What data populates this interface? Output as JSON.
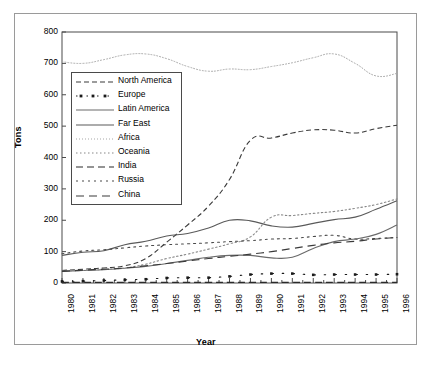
{
  "chart_data": {
    "type": "line",
    "title": "",
    "xlabel": "Year",
    "ylabel": "Tons",
    "xlim": [
      1980,
      1996
    ],
    "ylim": [
      0,
      800
    ],
    "ytick_labels": [
      "800",
      "700",
      "600",
      "500",
      "400",
      "300",
      "200",
      "100",
      "0"
    ],
    "ytick_values": [
      800,
      700,
      600,
      500,
      400,
      300,
      200,
      100,
      0
    ],
    "grid": false,
    "legend_position": "upper-left-inside",
    "x": [
      1980,
      1981,
      1982,
      1983,
      1984,
      1985,
      1986,
      1987,
      1988,
      1989,
      1990,
      1991,
      1992,
      1993,
      1994,
      1995,
      1996
    ],
    "categories": [
      "1980",
      "1981",
      "1982",
      "1983",
      "1984",
      "1985",
      "1986",
      "1987",
      "1988",
      "1989",
      "1990",
      "1991",
      "1992",
      "1993",
      "1994",
      "1995",
      "1996"
    ],
    "series": [
      {
        "name": "North America",
        "style": "dashed",
        "dash": "5,3",
        "color": "#3a3a3a",
        "values": [
          40,
          44,
          48,
          55,
          78,
          130,
          185,
          245,
          330,
          455,
          462,
          478,
          488,
          487,
          478,
          492,
          503
        ]
      },
      {
        "name": "Europe",
        "style": "dotted-square-markers",
        "dash": "1.5,9",
        "color": "#1a1a1a",
        "values": [
          5,
          6,
          8,
          10,
          12,
          16,
          17,
          17,
          21,
          27,
          30,
          30,
          26,
          27,
          27,
          27,
          28
        ]
      },
      {
        "name": "Latin America",
        "style": "solid",
        "dash": "none",
        "color": "#6a6a6a",
        "values": [
          37,
          40,
          42,
          47,
          53,
          62,
          72,
          82,
          88,
          88,
          80,
          82,
          110,
          132,
          140,
          155,
          185
        ]
      },
      {
        "name": "Far East",
        "style": "solid",
        "dash": "none",
        "color": "#5a5a5a",
        "values": [
          88,
          98,
          103,
          122,
          133,
          150,
          158,
          175,
          200,
          198,
          182,
          178,
          190,
          202,
          210,
          235,
          262
        ]
      },
      {
        "name": "Africa",
        "style": "dotted",
        "dash": "1,2",
        "color": "#a8a8a8",
        "values": [
          705,
          700,
          712,
          727,
          730,
          715,
          690,
          675,
          682,
          680,
          690,
          702,
          718,
          730,
          700,
          660,
          668
        ]
      },
      {
        "name": "Oceania",
        "style": "dotted-fine",
        "dash": "1.5,2.5",
        "color": "#888888",
        "values": [
          38,
          40,
          43,
          48,
          60,
          78,
          92,
          108,
          125,
          147,
          210,
          215,
          222,
          228,
          238,
          250,
          268
        ]
      },
      {
        "name": "India",
        "style": "dashed-long",
        "dash": "7,4",
        "color": "#2a2a2a",
        "values": [
          2,
          2,
          2,
          2,
          2,
          2,
          2,
          2,
          2,
          2,
          2,
          2,
          2,
          2,
          2,
          2,
          2
        ]
      },
      {
        "name": "Russia",
        "style": "dotted-sparse",
        "dash": "2,4",
        "color": "#4a4a4a",
        "values": [
          93,
          102,
          106,
          112,
          118,
          122,
          125,
          128,
          132,
          135,
          140,
          142,
          148,
          152,
          140,
          142,
          145
        ]
      },
      {
        "name": "China",
        "style": "dash-dash",
        "dash": "8,5",
        "color": "#3a3a3a",
        "values": [
          37,
          41,
          44,
          48,
          55,
          62,
          70,
          78,
          85,
          92,
          100,
          110,
          120,
          128,
          133,
          140,
          145
        ]
      }
    ]
  },
  "legend": {
    "items": [
      {
        "label": "North America"
      },
      {
        "label": "Europe"
      },
      {
        "label": "Latin America"
      },
      {
        "label": "Far East"
      },
      {
        "label": "Africa"
      },
      {
        "label": "Oceania"
      },
      {
        "label": "India"
      },
      {
        "label": "Russia"
      },
      {
        "label": "China"
      }
    ]
  },
  "axes": {
    "y_title": "Tons",
    "x_title": "Year"
  }
}
